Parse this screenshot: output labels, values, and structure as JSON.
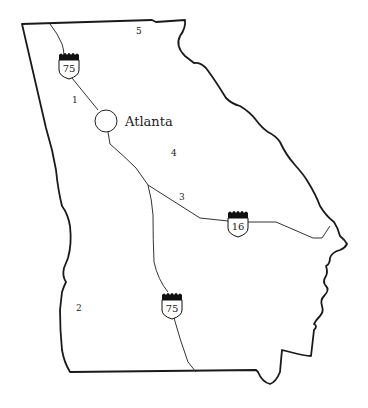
{
  "map": {
    "title": "Georgia",
    "city": {
      "name": "Atlanta"
    },
    "regions": [
      {
        "label": "1"
      },
      {
        "label": "2"
      },
      {
        "label": "3"
      },
      {
        "label": "4"
      },
      {
        "label": "5"
      }
    ],
    "shields": [
      {
        "route": "75",
        "position": "north"
      },
      {
        "route": "16",
        "position": "east"
      },
      {
        "route": "75",
        "position": "south"
      }
    ],
    "colors": {
      "border": "#1a1a1a",
      "road": "#333333",
      "background": "#ffffff"
    }
  }
}
